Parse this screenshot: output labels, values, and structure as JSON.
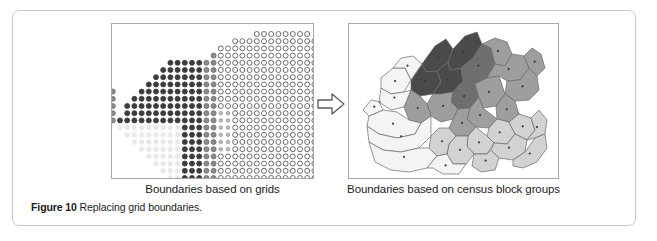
{
  "figure": {
    "caption_number": "Figure 10",
    "caption_text": "Replacing grid boundaries.",
    "border_color": "#c9c9c9"
  },
  "panels": {
    "left": {
      "caption": "Boundaries based on grids",
      "icon": "grid-dot-map",
      "border_color": "#a8a8a8",
      "dot_shades": {
        "dark": "#3c3c3c",
        "medium": "#8c8c8c",
        "open": "#ffffff",
        "faded": "#e8e8e8",
        "outline": "#555555"
      }
    },
    "right": {
      "caption": "Boundaries based on census block groups",
      "icon": "census-block-group-map",
      "border_color": "#a8a8a8",
      "fill_shades": {
        "darkest": "#4a4a4a",
        "dark": "#6e6e6e",
        "medium": "#9e9e9e",
        "light": "#d2d2d2",
        "lightest": "#f4f4f4",
        "stroke": "#6a6a6a"
      }
    }
  },
  "arrow": {
    "icon": "right-arrow-icon",
    "stroke": "#5a5a5a",
    "fill": "#ffffff"
  }
}
